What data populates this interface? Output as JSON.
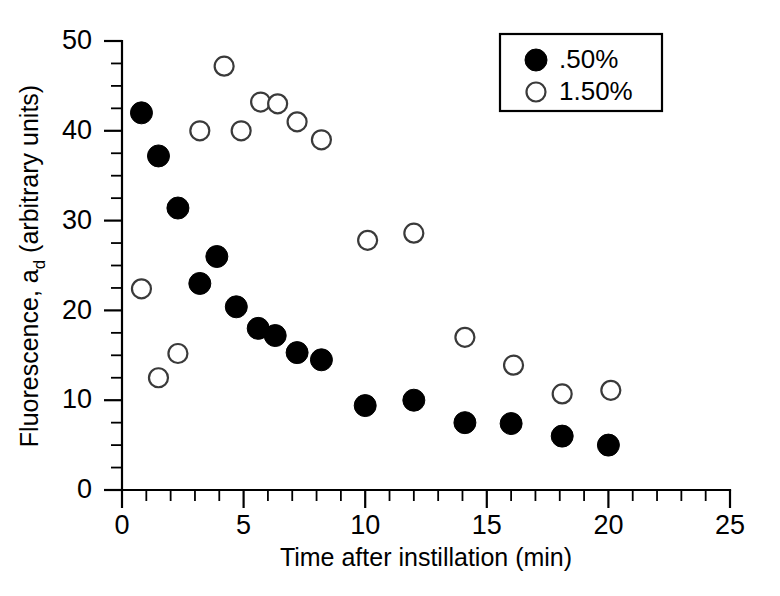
{
  "chart_data": {
    "type": "scatter",
    "title": "",
    "xlabel": "Time after instillation (min)",
    "ylabel": "Fluorescence, a",
    "ylabel_sub": "d",
    "ylabel_tail": " (arbitrary units)",
    "xlim": [
      0,
      25
    ],
    "ylim": [
      0,
      50
    ],
    "xticks": [
      0,
      5,
      10,
      15,
      20,
      25
    ],
    "yticks": [
      0,
      10,
      20,
      30,
      40,
      50
    ],
    "xtick_labels": [
      "0",
      "5",
      "10",
      "15",
      "20",
      "25"
    ],
    "ytick_labels": [
      "0",
      "10",
      "20",
      "30",
      "40",
      "50"
    ],
    "x_minor_step": 1,
    "y_minor_step": 2.5,
    "grid": false,
    "legend_position": "top-right",
    "series": [
      {
        "name": ".50%",
        "marker": "filled-circle",
        "color": "#000000",
        "points": [
          [
            0.8,
            42.0
          ],
          [
            1.5,
            37.2
          ],
          [
            2.3,
            31.4
          ],
          [
            3.2,
            23.0
          ],
          [
            3.9,
            26.0
          ],
          [
            4.7,
            20.4
          ],
          [
            5.6,
            18.0
          ],
          [
            6.3,
            17.2
          ],
          [
            7.2,
            15.3
          ],
          [
            8.2,
            14.5
          ],
          [
            10.0,
            9.4
          ],
          [
            12.0,
            10.0
          ],
          [
            14.1,
            7.5
          ],
          [
            16.0,
            7.4
          ],
          [
            18.1,
            6.0
          ],
          [
            20.0,
            5.0
          ]
        ]
      },
      {
        "name": "1.50%",
        "marker": "open-circle",
        "color": "#ffffff",
        "points": [
          [
            0.8,
            22.4
          ],
          [
            1.5,
            12.5
          ],
          [
            2.3,
            15.2
          ],
          [
            3.2,
            40.0
          ],
          [
            4.2,
            47.2
          ],
          [
            4.9,
            40.0
          ],
          [
            5.7,
            43.2
          ],
          [
            6.4,
            43.0
          ],
          [
            7.2,
            41.0
          ],
          [
            8.2,
            39.0
          ],
          [
            10.1,
            27.8
          ],
          [
            12.0,
            28.6
          ],
          [
            14.1,
            17.0
          ],
          [
            16.1,
            13.9
          ],
          [
            18.1,
            10.7
          ],
          [
            20.1,
            11.1
          ]
        ]
      }
    ]
  },
  "legend": {
    "entries": [
      {
        "label": ".50%",
        "marker": "filled-circle"
      },
      {
        "label": "1.50%",
        "marker": "open-circle"
      }
    ]
  }
}
